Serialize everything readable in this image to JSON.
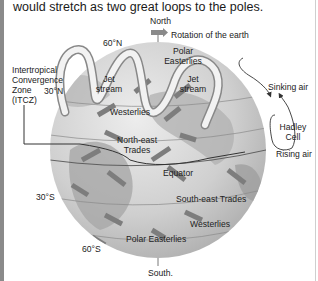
{
  "caption": "would stretch as two great loops to the poles.",
  "diagram": {
    "labels": {
      "north": "North",
      "rotation": "Rotation of the earth",
      "lat_60n": "60°N",
      "polar_easterlies_n_1": "Polar",
      "polar_easterlies_n_2": "Easterlies",
      "itcz_1": "Intertropical",
      "itcz_2": "Convergence",
      "itcz_3": "Zone",
      "itcz_4": "(ITCZ)",
      "lat_30n": "30°N",
      "jet_stream_left_1": "Jet",
      "jet_stream_left_2": "stream",
      "jet_stream_right_1": "Jet",
      "jet_stream_right_2": "stream",
      "westerlies_n": "Westerlies",
      "sinking_air": "Sinking air",
      "ne_trades_1": "North-east",
      "ne_trades_2": "Trades",
      "hadley_1": "Hadley",
      "hadley_2": "Cell",
      "rising_air": "Rising air",
      "equator": "Equator",
      "lat_30s": "30°S",
      "se_trades": "South-east Trades",
      "westerlies_s": "Westerlies",
      "lat_60s": "60°S",
      "polar_easterlies_s": "Polar Easterlies",
      "south": "South."
    },
    "colors": {
      "globe_fill": "#c9c9c9",
      "globe_light": "#e4e4e4",
      "land": "#a8a8a8",
      "arrow": "#7d7d7d",
      "jet": "#f2f2f2",
      "line": "#333333"
    }
  }
}
